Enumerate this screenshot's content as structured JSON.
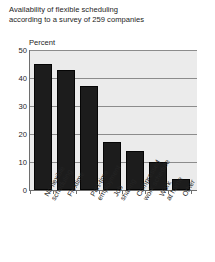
{
  "title": {
    "line1": "Availability of flexible scheduling",
    "line2": "according to a survey of 259 companies"
  },
  "axis_caption": "Percent",
  "chart_data": {
    "type": "bar",
    "title": "Availability of flexible scheduling according to a survey of 259 companies",
    "xlabel": "",
    "ylabel": "Percent",
    "ylim": [
      0,
      50
    ],
    "yticks": [
      0,
      10,
      20,
      30,
      40,
      50
    ],
    "grid": true,
    "legend": "none",
    "bar_color": "#1c1c1c",
    "plot_background": "#ebebeb",
    "categories": [
      "No flexible scheduling",
      "Flextime",
      "Part-time employment",
      "Job sharing",
      "Compressed work schedule",
      "Work at home",
      "Other"
    ],
    "category_lines": [
      [
        "No flexible",
        "scheduling"
      ],
      [
        "Flextime"
      ],
      [
        "Part-time",
        "employment"
      ],
      [
        "Job",
        "sharing"
      ],
      [
        "Compressed",
        "work schedule"
      ],
      [
        "Work",
        "at home"
      ],
      [
        "Other"
      ]
    ],
    "values": [
      45,
      43,
      37,
      17,
      14,
      10,
      4
    ]
  }
}
